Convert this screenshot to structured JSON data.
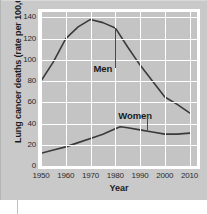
{
  "figure": {
    "background_color": "#c9c9c9",
    "plot_background_color": "#c4c4c4",
    "grid_color": "#ffffff",
    "line_color": "#3a3a3a"
  },
  "chart_data": {
    "type": "line",
    "title": "",
    "xlabel": "Year",
    "ylabel": "Lung cancer deaths (rate per 100,000)",
    "xlim": [
      1950,
      2013
    ],
    "ylim": [
      0,
      145
    ],
    "xticks": [
      1950,
      1960,
      1970,
      1980,
      1990,
      2000,
      2010
    ],
    "xticklabels": [
      "1950",
      "1960",
      "1970",
      "1980",
      "1990",
      "2000",
      "2010"
    ],
    "yticks": [
      0,
      20,
      40,
      60,
      80,
      100,
      120,
      140
    ],
    "yticklabels": [
      "0",
      "20",
      "40",
      "60",
      "80",
      "100",
      "120",
      "140"
    ],
    "grid": true,
    "legend": "inline-labels",
    "series": [
      {
        "name": "Men",
        "label_position": {
          "x": 1975,
          "y": 92
        },
        "leader_line_to": {
          "x": 1980,
          "y": 130
        },
        "x": [
          1950,
          1955,
          1960,
          1965,
          1970,
          1975,
          1980,
          1985,
          1990,
          1995,
          2000,
          2005,
          2010
        ],
        "values": [
          80,
          98,
          120,
          131,
          138,
          135,
          130,
          112,
          95,
          80,
          65,
          58,
          50
        ]
      },
      {
        "name": "Women",
        "label_position": {
          "x": 1988,
          "y": 48
        },
        "leader_line_to": {
          "x": 1993,
          "y": 34
        },
        "x": [
          1950,
          1955,
          1960,
          1965,
          1970,
          1975,
          1980,
          1982,
          1985,
          1990,
          1995,
          2000,
          2005,
          2010
        ],
        "values": [
          12,
          15,
          18,
          22,
          26,
          30,
          35,
          37,
          36,
          34,
          32,
          30,
          30,
          31
        ]
      }
    ]
  }
}
